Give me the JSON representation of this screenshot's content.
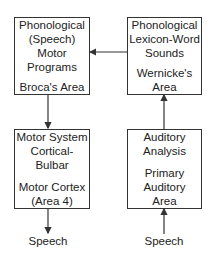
{
  "diagram": {
    "boxes": {
      "broca": {
        "title_lines": [
          "Phonological",
          "(Speech)",
          "Motor",
          "Programs"
        ],
        "area_lines": [
          "Broca's Area"
        ]
      },
      "wernicke": {
        "title_lines": [
          "Phonological",
          "Lexicon-Word",
          "Sounds"
        ],
        "area_lines": [
          "Wernicke's",
          "Area"
        ]
      },
      "motor": {
        "title_lines": [
          "Motor System",
          "Cortical-",
          "Bulbar"
        ],
        "area_lines": [
          "Motor Cortex",
          "(Area 4)"
        ]
      },
      "auditory": {
        "title_lines": [
          "Auditory",
          "Analysis"
        ],
        "area_lines": [
          "Primary",
          "Auditory",
          "Area"
        ]
      }
    },
    "outputs": {
      "speech_out": "Speech",
      "speech_in": "Speech"
    },
    "arrows": [
      {
        "from": "wernicke",
        "to": "broca"
      },
      {
        "from": "broca",
        "to": "motor"
      },
      {
        "from": "motor",
        "to": "speech_out"
      },
      {
        "from": "speech_in",
        "to": "auditory"
      },
      {
        "from": "auditory",
        "to": "wernicke"
      }
    ],
    "colors": {
      "line": "#333333",
      "background": "#ffffff"
    }
  }
}
